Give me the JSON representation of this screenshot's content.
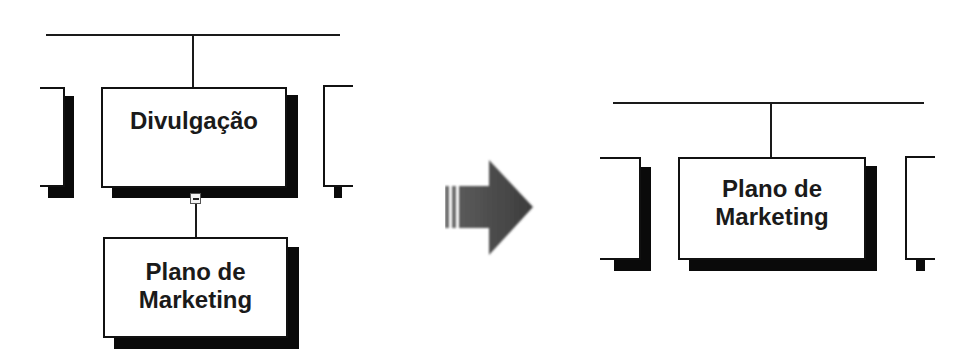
{
  "before": {
    "title": "before-collapse",
    "parent_node": {
      "label": "Divulgação"
    },
    "child_node": {
      "label_line1": "Plano de",
      "label_line2": "Marketing"
    },
    "collapse_button": {
      "icon": "minus-icon"
    }
  },
  "transition": {
    "icon": "right-arrow-icon",
    "color": "#4a4a4a"
  },
  "after": {
    "title": "after-collapse",
    "node": {
      "label_line1": "Plano de",
      "label_line2": "Marketing"
    }
  },
  "colors": {
    "line": "#1a1a1a",
    "shadow": "#0a0a0a",
    "box_fill": "#ffffff"
  }
}
